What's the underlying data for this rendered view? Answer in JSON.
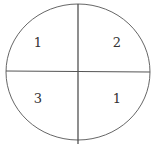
{
  "diagram": {
    "type": "circle-divided-into-quadrants",
    "quadrants": [
      {
        "position": "top-left",
        "label": "1"
      },
      {
        "position": "top-right",
        "label": "2"
      },
      {
        "position": "bottom-left",
        "label": "3"
      },
      {
        "position": "bottom-right",
        "label": "1"
      }
    ],
    "stroke_color": "#555555"
  }
}
